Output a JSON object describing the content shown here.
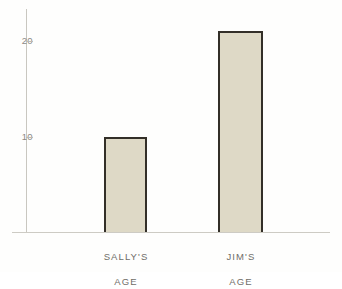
{
  "chart_data": {
    "type": "bar",
    "title": "",
    "subtitle": "",
    "xlabel": "",
    "ylabel": "",
    "categories": [
      "SALLY'S\nAGE",
      "JIM'S\nAGE"
    ],
    "category_lines": [
      [
        "SALLY'S",
        "AGE"
      ],
      [
        "JIM'S",
        "AGE"
      ]
    ],
    "values": [
      10,
      21
    ],
    "ylim": [
      0,
      23.3
    ],
    "yticks": [
      10,
      20
    ],
    "ytick_labels": [
      "10",
      "20"
    ],
    "grid": false,
    "legend": null,
    "annotations": [],
    "colors": {
      "bar_fill": "#ded9c6",
      "bar_edge": "#332f28",
      "axis_line": "#c9c7c0",
      "tick_label": "#8d8b86",
      "category_label": "#6f6d68",
      "background": "#fefefd"
    }
  },
  "axes": {
    "y_tick_20": {
      "label": "20",
      "value": 20
    },
    "y_tick_10": {
      "label": "10",
      "value": 10
    }
  },
  "bars": {
    "sally": {
      "label_line1": "SALLY'S",
      "label_line2": "AGE",
      "value": 10
    },
    "jim": {
      "label_line1": "JIM'S",
      "label_line2": "AGE",
      "value": 21
    }
  }
}
